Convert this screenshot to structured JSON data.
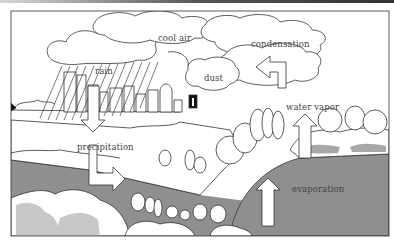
{
  "diagram": {
    "labels": {
      "cool_air": "cool air",
      "rain": "rain",
      "dust": "dust",
      "condensation": "condensation",
      "water_vapor": "water vapor",
      "precipitation": "precipitation",
      "evaporation": "evaporation"
    },
    "colors": {
      "water": "#8f8f8f",
      "land_shadow": "#c8c8c8",
      "outline": "#333333",
      "background": "#ffffff"
    }
  }
}
